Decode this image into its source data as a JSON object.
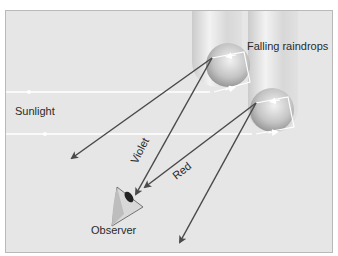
{
  "diagram": {
    "labels": {
      "sunlight": "Sunlight",
      "raindrops": "Falling raindrops",
      "violet": "Violet",
      "red": "Red",
      "observer": "Observer"
    },
    "colors": {
      "background": "#e6e6e6",
      "border": "#b9b9b9",
      "ray": "#4a4a4a",
      "sunlight_beam": "#ffffff",
      "text": "#2a2a2a"
    }
  }
}
